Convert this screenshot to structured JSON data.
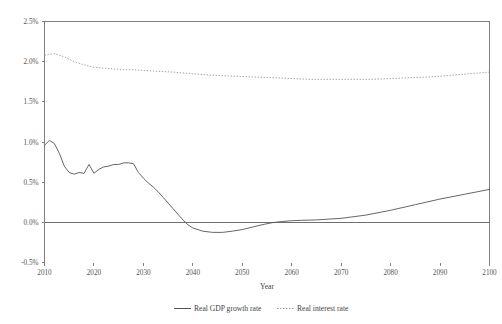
{
  "chart_data": {
    "type": "line",
    "title": "",
    "xlabel": "Year",
    "ylabel": "",
    "xlim": [
      2010,
      2100
    ],
    "ylim": [
      -0.5,
      2.5
    ],
    "grid": false,
    "legend_position": "bottom",
    "x_tick_labels": [
      "2010",
      "2020",
      "2030",
      "2040",
      "2050",
      "2060",
      "2070",
      "2080",
      "2090",
      "2100"
    ],
    "x_ticks": [
      2010,
      2020,
      2030,
      2040,
      2050,
      2060,
      2070,
      2080,
      2090,
      2100
    ],
    "y_tick_labels": [
      "2.5%",
      "2.0%",
      "1.5%",
      "1.0%",
      "0.5%",
      "0.0%",
      "-0.5%"
    ],
    "y_ticks": [
      2.5,
      2.0,
      1.5,
      1.0,
      0.5,
      0.0,
      -0.5
    ],
    "y_unit": "%",
    "zero_reference_line": 0.0,
    "series": [
      {
        "name": "Real GDP growth rate",
        "style": "solid",
        "color": "#555555",
        "x": [
          2010,
          2011,
          2012,
          2013,
          2014,
          2015,
          2016,
          2017,
          2018,
          2019,
          2020,
          2021,
          2022,
          2023,
          2024,
          2025,
          2026,
          2027,
          2028,
          2029,
          2030,
          2031,
          2032,
          2033,
          2034,
          2035,
          2036,
          2037,
          2038,
          2039,
          2040,
          2042,
          2044,
          2046,
          2048,
          2050,
          2052,
          2054,
          2056,
          2058,
          2060,
          2062,
          2065,
          2070,
          2075,
          2080,
          2085,
          2090,
          2095,
          2100
        ],
        "values": [
          0.96,
          1.02,
          0.98,
          0.86,
          0.7,
          0.62,
          0.6,
          0.62,
          0.61,
          0.72,
          0.61,
          0.66,
          0.69,
          0.7,
          0.72,
          0.72,
          0.74,
          0.74,
          0.73,
          0.62,
          0.55,
          0.49,
          0.44,
          0.38,
          0.31,
          0.24,
          0.17,
          0.1,
          0.03,
          -0.03,
          -0.07,
          -0.11,
          -0.125,
          -0.125,
          -0.11,
          -0.09,
          -0.06,
          -0.03,
          -0.005,
          0.01,
          0.02,
          0.025,
          0.03,
          0.05,
          0.09,
          0.15,
          0.22,
          0.29,
          0.35,
          0.41
        ]
      },
      {
        "name": "Real interest rate",
        "style": "dotted",
        "color": "#9a9a9a",
        "x": [
          2010,
          2012,
          2014,
          2016,
          2018,
          2020,
          2022,
          2024,
          2026,
          2028,
          2030,
          2033,
          2036,
          2040,
          2044,
          2048,
          2052,
          2056,
          2060,
          2064,
          2068,
          2072,
          2076,
          2080,
          2084,
          2088,
          2092,
          2096,
          2100
        ],
        "values": [
          2.08,
          2.1,
          2.06,
          2.0,
          1.96,
          1.93,
          1.92,
          1.91,
          1.9,
          1.9,
          1.89,
          1.88,
          1.87,
          1.85,
          1.83,
          1.82,
          1.81,
          1.8,
          1.79,
          1.78,
          1.78,
          1.78,
          1.78,
          1.79,
          1.8,
          1.81,
          1.83,
          1.85,
          1.87
        ]
      }
    ],
    "legend": [
      {
        "label": "Real GDP growth rate",
        "style": "solid",
        "color": "#555555"
      },
      {
        "label": "Real interest rate",
        "style": "dotted",
        "color": "#9a9a9a"
      }
    ]
  }
}
